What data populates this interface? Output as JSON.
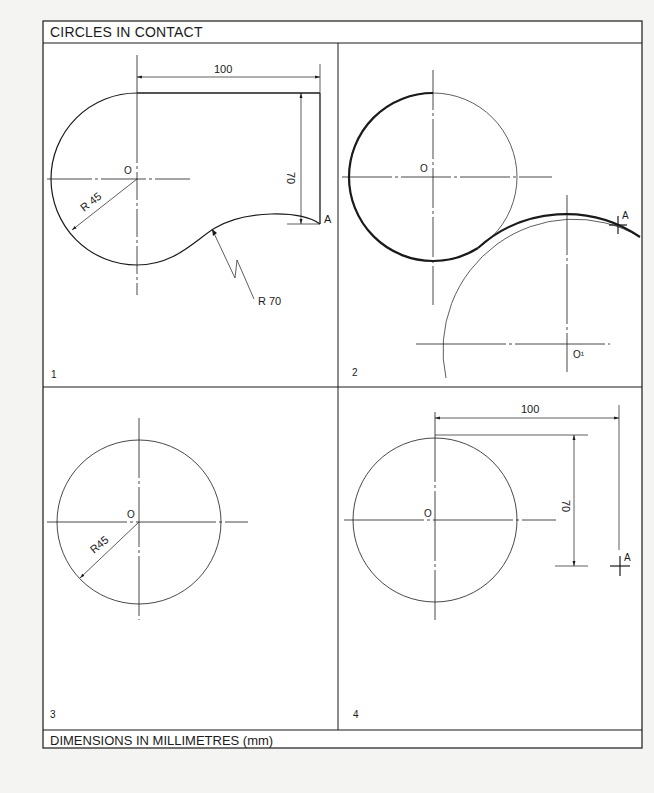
{
  "sheet": {
    "title": "CIRCLES IN CONTACT",
    "footer": "DIMENSIONS IN MILLIMETRES (mm)"
  },
  "panels": [
    {
      "number": "1",
      "center_label": "O",
      "dim_horizontal": "100",
      "dim_vertical": "70",
      "radius_label_small": "R 45",
      "radius_label_large": "R 70",
      "point_label": "A"
    },
    {
      "number": "2",
      "center_label": "O",
      "center2_label": "O¹",
      "point_label": "A"
    },
    {
      "number": "3",
      "center_label": "O",
      "radius_label": "R45"
    },
    {
      "number": "4",
      "center_label": "O",
      "dim_horizontal": "100",
      "dim_vertical": "70",
      "point_label": "A"
    }
  ],
  "colors": {
    "ink": "#1a1a1a",
    "paper": "#ffffff",
    "background": "#f4f4f3"
  }
}
